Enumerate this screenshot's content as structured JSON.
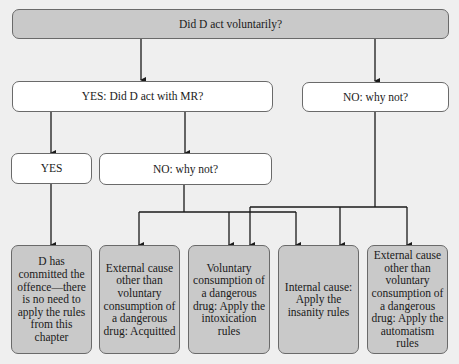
{
  "diagram": {
    "root": {
      "label": "Did D act voluntarily?"
    },
    "level2": {
      "yes": {
        "label": "YES: Did D act with MR?"
      },
      "no": {
        "label": "NO: why not?"
      }
    },
    "level3": {
      "yes": {
        "label": "YES"
      },
      "no": {
        "label": "NO: why not?"
      }
    },
    "outcomes": [
      {
        "label": "D has committed the offence—there is no need to apply the rules from this chapter"
      },
      {
        "label": "External cause other than voluntary consumption of a dangerous drug: Acquitted"
      },
      {
        "label": "Voluntary consumption of a dangerous drug: Apply the intoxication rules"
      },
      {
        "label": "Internal cause: Apply the insanity rules"
      },
      {
        "label": "External cause other than voluntary consumption of a dangerous drug: Apply the automatism rules"
      }
    ],
    "colors": {
      "decision_fill": "#c9c9c9",
      "question_fill": "#ffffff",
      "line": "#1a1a1a",
      "background": "#efefef"
    }
  }
}
